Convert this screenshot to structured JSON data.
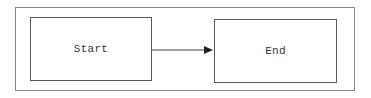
{
  "diagram": {
    "type": "flowchart",
    "frame": {
      "border_color": "#8a8a8a"
    },
    "nodes": [
      {
        "id": "start",
        "label": "Start"
      },
      {
        "id": "end",
        "label": "End"
      }
    ],
    "edges": [
      {
        "from": "start",
        "to": "end",
        "arrow": "filled-triangle",
        "color": "#333333"
      }
    ]
  }
}
